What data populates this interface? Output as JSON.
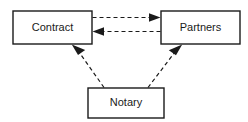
{
  "diagram": {
    "type": "node-edge-diagram",
    "background_color": "#ffffff",
    "line_color": "#1a1a1a",
    "text_color": "#1a1a1a",
    "nodes": [
      {
        "id": "contract",
        "label": "Contract",
        "shape": "rectangle",
        "x": 13,
        "y": 11,
        "width": 79,
        "height": 33
      },
      {
        "id": "partners",
        "label": "Partners",
        "shape": "rectangle",
        "x": 161,
        "y": 11,
        "width": 79,
        "height": 33
      },
      {
        "id": "notary",
        "label": "Notary",
        "shape": "rectangle",
        "x": 88,
        "y": 88,
        "width": 76,
        "height": 30
      }
    ],
    "edges": [
      {
        "id": "contract-to-partners",
        "from": "contract",
        "to": "partners",
        "style": "dashed",
        "arrowhead": "filled-triangle",
        "direction": "right",
        "label": ""
      },
      {
        "id": "partners-to-contract",
        "from": "partners",
        "to": "contract",
        "style": "dashed",
        "arrowhead": "filled-triangle",
        "direction": "left",
        "label": ""
      },
      {
        "id": "notary-to-contract",
        "from": "notary",
        "to": "contract",
        "style": "dashed",
        "arrowhead": "filled-triangle",
        "direction": "up-left",
        "label": ""
      },
      {
        "id": "notary-to-partners",
        "from": "notary",
        "to": "partners",
        "style": "dashed",
        "arrowhead": "filled-triangle",
        "direction": "up-right",
        "label": ""
      }
    ]
  }
}
